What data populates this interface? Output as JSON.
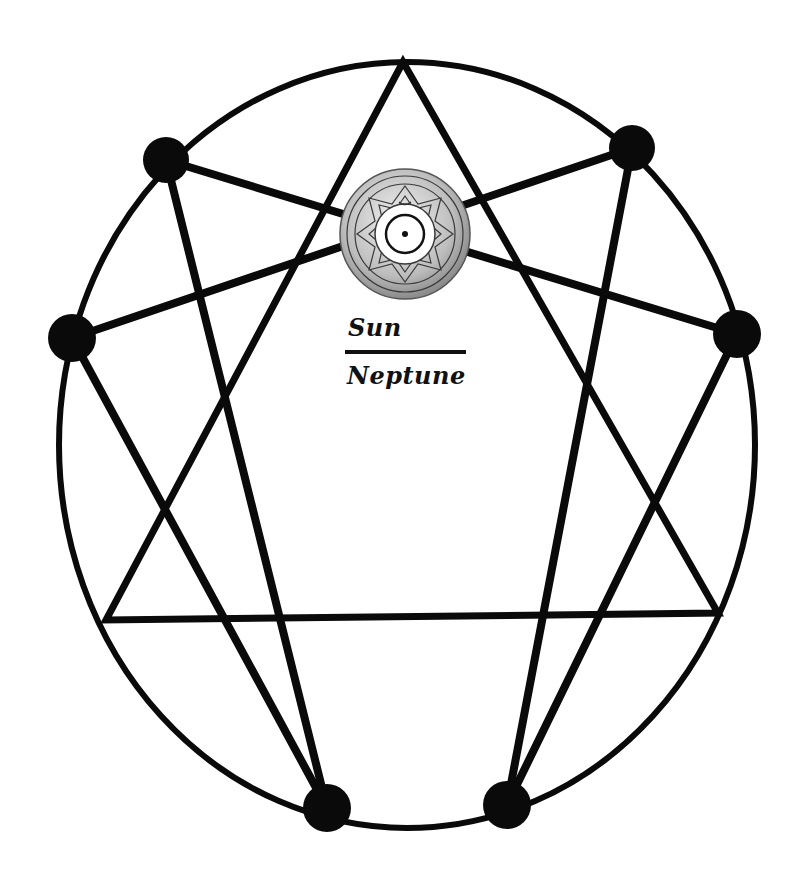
{
  "diagram": {
    "type": "enneagram",
    "colors": {
      "stroke": "#0a0a0a",
      "background": "#ffffff",
      "sun_fill": "#cfcfcf",
      "sun_pattern": "#3a3a3a"
    },
    "outer_circle": {
      "cx": 407,
      "cy": 445,
      "rx": 348,
      "ry": 383
    },
    "triangle": {
      "apex": [
        403,
        62
      ],
      "base_left": [
        106,
        620
      ],
      "base_right": [
        718,
        613
      ]
    },
    "nodes": [
      {
        "id": "top-left",
        "x": 166,
        "y": 160
      },
      {
        "id": "top-right",
        "x": 632,
        "y": 148
      },
      {
        "id": "left",
        "x": 72,
        "y": 338
      },
      {
        "id": "right",
        "x": 737,
        "y": 334
      },
      {
        "id": "bottom-left",
        "x": 327,
        "y": 808
      },
      {
        "id": "bottom-right",
        "x": 507,
        "y": 805
      }
    ],
    "connections": [
      [
        "top-left",
        "right"
      ],
      [
        "top-right",
        "left"
      ],
      [
        "left",
        "bottom-left"
      ],
      [
        "top-left",
        "bottom-left"
      ],
      [
        "right",
        "bottom-right"
      ],
      [
        "top-right",
        "bottom-right"
      ]
    ],
    "center_symbol": {
      "name": "sun-mandala",
      "cx": 405,
      "cy": 234,
      "r": 65
    },
    "label": {
      "numerator": "Sun",
      "denominator": "Neptune"
    }
  }
}
